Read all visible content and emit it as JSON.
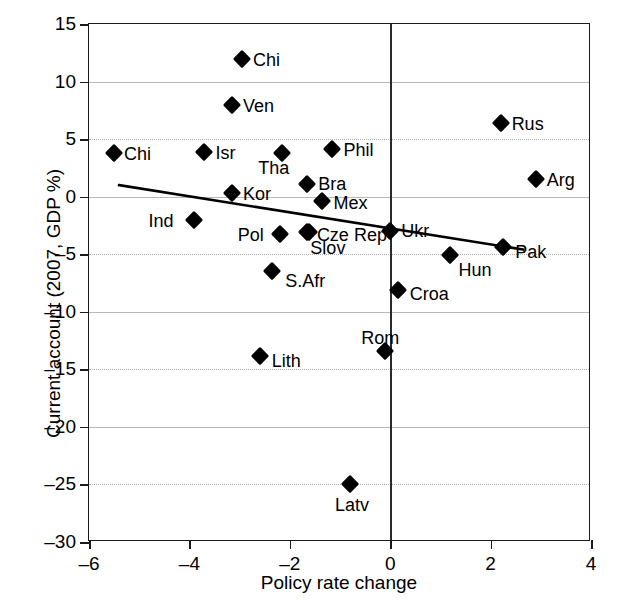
{
  "chart_data": {
    "type": "scatter",
    "title": "",
    "xlabel": "Policy rate change",
    "ylabel": "Current account (2007, GDP %)",
    "xlim": [
      -6,
      4
    ],
    "ylim": [
      -30,
      15
    ],
    "xticks": [
      "-6",
      "-4",
      "-2",
      "0",
      "2",
      "4"
    ],
    "xtick_values": [
      -6,
      -4,
      -2,
      0,
      2,
      4
    ],
    "yticks": [
      "15",
      "10",
      "5",
      "0",
      "-5",
      "-10",
      "-15",
      "-20",
      "-25",
      "-30"
    ],
    "ytick_values": [
      15,
      10,
      5,
      0,
      -5,
      -10,
      -15,
      -20,
      -25,
      -30
    ],
    "grid": true,
    "legend": "none",
    "marker": "diamond",
    "marker_color": "#000000",
    "points": [
      {
        "label": "Chi",
        "x": -2.95,
        "y": 12.0,
        "label_dx": 11,
        "label_dy": -8
      },
      {
        "label": "Ven",
        "x": -3.15,
        "y": 8.0,
        "label_dx": 11,
        "label_dy": -8
      },
      {
        "label": "Rus",
        "x": 2.2,
        "y": 6.4,
        "label_dx": 11,
        "label_dy": -8
      },
      {
        "label": "Chi",
        "x": -5.5,
        "y": 3.8,
        "label_dx": 10,
        "label_dy": -8
      },
      {
        "label": "Isr",
        "x": -3.7,
        "y": 3.9,
        "label_dx": 11,
        "label_dy": -8
      },
      {
        "label": "Tha",
        "x": -2.15,
        "y": 3.8,
        "label_dx": -24,
        "label_dy": 6
      },
      {
        "label": "Phil",
        "x": -1.15,
        "y": 4.1,
        "label_dx": 11,
        "label_dy": -8
      },
      {
        "label": "Arg",
        "x": 2.9,
        "y": 1.5,
        "label_dx": 11,
        "label_dy": -8
      },
      {
        "label": "Bra",
        "x": -1.65,
        "y": 1.1,
        "label_dx": 11,
        "label_dy": -9
      },
      {
        "label": "Kor",
        "x": -3.15,
        "y": 0.3,
        "label_dx": 11,
        "label_dy": -8
      },
      {
        "label": "Mex",
        "x": -1.35,
        "y": -0.4,
        "label_dx": 11,
        "label_dy": -7
      },
      {
        "label": "Ind",
        "x": -3.9,
        "y": -2.0,
        "label_dx": -46,
        "label_dy": -8
      },
      {
        "label": "Ukr",
        "x": 0.0,
        "y": -3.0,
        "label_dx": 11,
        "label_dy": -9
      },
      {
        "label": "Pol",
        "x": -2.2,
        "y": -3.2,
        "label_dx": -42,
        "label_dy": -8
      },
      {
        "label": "Slov",
        "x": -1.65,
        "y": -3.1,
        "label_dx": 3,
        "label_dy": 7
      },
      {
        "label": "Cze Rep",
        "x": -1.62,
        "y": -3.1,
        "label_dx": 8,
        "label_dy": -6
      },
      {
        "label": "Pak",
        "x": 2.25,
        "y": -4.4,
        "label_dx": 12,
        "label_dy": -4
      },
      {
        "label": "Hun",
        "x": 1.2,
        "y": -5.1,
        "label_dx": 8,
        "label_dy": 6
      },
      {
        "label": "S.Afr",
        "x": -2.35,
        "y": -6.5,
        "label_dx": 13,
        "label_dy": 1
      },
      {
        "label": "Croa",
        "x": 0.15,
        "y": -8.1,
        "label_dx": 12,
        "label_dy": -5
      },
      {
        "label": "Lith",
        "x": -2.6,
        "y": -13.8,
        "label_dx": 12,
        "label_dy": -4
      },
      {
        "label": "Rom",
        "x": -0.1,
        "y": -13.4,
        "label_dx": -24,
        "label_dy": -22
      },
      {
        "label": "Latv",
        "x": -0.8,
        "y": -25.0,
        "label_dx": -15,
        "label_dy": 12
      }
    ],
    "trend_line": {
      "x1": -5.4,
      "y1": 1.0,
      "x2": 2.65,
      "y2": -4.6,
      "color": "#000000",
      "width": 2.6
    }
  }
}
